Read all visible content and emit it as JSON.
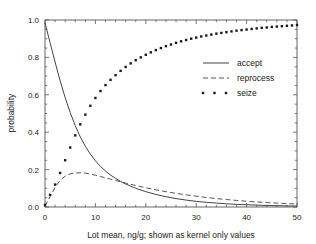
{
  "chart_data": {
    "type": "line",
    "title": "",
    "xlabel": "Lot mean, ng/g; shown as kernel only values",
    "ylabel": "probability",
    "xlim": [
      0,
      50
    ],
    "ylim": [
      0.0,
      1.0
    ],
    "xticks": [
      0,
      10,
      20,
      30,
      40,
      50
    ],
    "xtick_labels": [
      "0",
      "10",
      "20",
      "30",
      "40",
      "50"
    ],
    "yticks": [
      0.0,
      0.2,
      0.4,
      0.6,
      0.8,
      1.0
    ],
    "ytick_labels": [
      "0.0",
      "0.2",
      "0.4",
      "0.6",
      "0.8",
      "1.0"
    ],
    "x_minor_step": 2,
    "y_minor_step": 0.05,
    "grid": false,
    "frame": "box",
    "legend_position": "center-right",
    "series": [
      {
        "name": "accept",
        "style": "solid",
        "color": "#444444",
        "x": [
          0,
          1,
          2,
          3,
          4,
          5,
          6,
          7,
          8,
          9,
          10,
          11,
          12,
          13,
          14,
          15,
          16,
          18,
          20,
          22,
          24,
          26,
          28,
          30,
          32,
          34,
          36,
          38,
          40,
          42,
          44,
          46,
          48,
          50
        ],
        "y": [
          0.985,
          0.88,
          0.775,
          0.675,
          0.585,
          0.505,
          0.435,
          0.375,
          0.325,
          0.283,
          0.247,
          0.217,
          0.192,
          0.171,
          0.153,
          0.137,
          0.123,
          0.1,
          0.082,
          0.067,
          0.055,
          0.045,
          0.037,
          0.03,
          0.025,
          0.021,
          0.017,
          0.014,
          0.012,
          0.01,
          0.008,
          0.007,
          0.006,
          0.005
        ]
      },
      {
        "name": "reprocess",
        "style": "dashed",
        "color": "#555555",
        "x": [
          0,
          1,
          2,
          3,
          4,
          5,
          6,
          7,
          8,
          9,
          10,
          11,
          12,
          13,
          14,
          15,
          16,
          18,
          20,
          22,
          24,
          26,
          28,
          30,
          32,
          34,
          36,
          38,
          40,
          42,
          44,
          46,
          48,
          50
        ],
        "y": [
          0.005,
          0.055,
          0.105,
          0.143,
          0.165,
          0.177,
          0.182,
          0.183,
          0.181,
          0.176,
          0.17,
          0.163,
          0.156,
          0.149,
          0.142,
          0.135,
          0.128,
          0.115,
          0.103,
          0.092,
          0.082,
          0.073,
          0.065,
          0.058,
          0.051,
          0.045,
          0.04,
          0.035,
          0.031,
          0.027,
          0.024,
          0.021,
          0.018,
          0.016
        ]
      },
      {
        "name": "seize",
        "style": "dotted-markers",
        "color": "#1a1a1a",
        "x": [
          0,
          1,
          2,
          3,
          4,
          5,
          6,
          7,
          8,
          9,
          10,
          11,
          12,
          13,
          14,
          15,
          16,
          17,
          18,
          19,
          20,
          21,
          22,
          23,
          24,
          25,
          26,
          27,
          28,
          29,
          30,
          31,
          32,
          33,
          34,
          35,
          36,
          37,
          38,
          39,
          40,
          41,
          42,
          43,
          44,
          45,
          46,
          47,
          48,
          49,
          50
        ],
        "y": [
          0.01,
          0.065,
          0.12,
          0.182,
          0.25,
          0.318,
          0.383,
          0.442,
          0.494,
          0.541,
          0.583,
          0.62,
          0.652,
          0.68,
          0.705,
          0.728,
          0.749,
          0.768,
          0.785,
          0.8,
          0.814,
          0.827,
          0.839,
          0.85,
          0.86,
          0.869,
          0.878,
          0.886,
          0.893,
          0.9,
          0.906,
          0.912,
          0.917,
          0.922,
          0.927,
          0.931,
          0.935,
          0.939,
          0.943,
          0.946,
          0.949,
          0.952,
          0.955,
          0.958,
          0.96,
          0.963,
          0.965,
          0.967,
          0.969,
          0.971,
          0.973
        ]
      }
    ],
    "legend": [
      {
        "label": "accept",
        "style": "solid"
      },
      {
        "label": "reprocess",
        "style": "dashed"
      },
      {
        "label": "seize",
        "style": "dotted-markers"
      }
    ]
  }
}
